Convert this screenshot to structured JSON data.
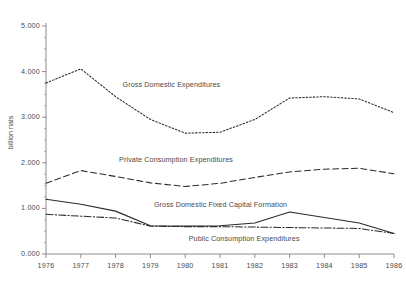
{
  "chart_data": {
    "type": "line",
    "title": "",
    "xlabel": "",
    "ylabel": "billion rials",
    "x": [
      1976,
      1977,
      1978,
      1979,
      1980,
      1981,
      1982,
      1983,
      1984,
      1985,
      1986
    ],
    "xtick_labels": [
      "1976",
      "1977",
      "1978",
      "1979",
      "1980",
      "1981",
      "1982",
      "1983",
      "1984",
      "1985",
      "1986"
    ],
    "ytick_labels": [
      "0.000",
      "1.000",
      "2.000",
      "3.000",
      "4.000",
      "5.000"
    ],
    "ytick_values": [
      0,
      1000,
      2000,
      3000,
      4000,
      5000
    ],
    "ylim": [
      0,
      5000
    ],
    "xlim": [
      1976,
      1986
    ],
    "grid": false,
    "legend_position": "inline-annotations",
    "minor_ticks": true,
    "series": [
      {
        "name": "Gross Domestic Expenditures",
        "style": "dotted",
        "color": "#2b2b2b",
        "label_x": 1978.2,
        "label_y": 3700,
        "values": [
          3750,
          4060,
          3450,
          2950,
          2650,
          2670,
          2950,
          3420,
          3450,
          3400,
          3100
        ]
      },
      {
        "name": "Private Consumption Expenditures",
        "style": "dashed",
        "color": "#2b2b2b",
        "label_x": 1978.1,
        "label_y": 2060,
        "values": [
          1550,
          1830,
          1700,
          1560,
          1480,
          1550,
          1680,
          1800,
          1860,
          1880,
          1760
        ]
      },
      {
        "name": "Gross Domestic Fixed Capital Formation",
        "style": "solid",
        "color": "#2b2b2b",
        "label_x": 1979.1,
        "label_y": 1070,
        "values": [
          1200,
          1090,
          940,
          620,
          610,
          620,
          680,
          920,
          800,
          680,
          450
        ]
      },
      {
        "name": "Public Consumption Expenditures",
        "style": "dash-dot",
        "color": "#2b2b2b",
        "label_x": 1980.1,
        "label_y": 330,
        "values": [
          870,
          830,
          790,
          610,
          600,
          600,
          590,
          580,
          570,
          560,
          450
        ]
      }
    ]
  }
}
